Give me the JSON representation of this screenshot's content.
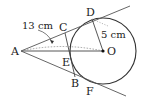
{
  "diagram": {
    "type": "geometry",
    "colors": {
      "stroke": "#333333",
      "dotted": "#888888",
      "background": "#ffffff"
    },
    "points": {
      "A": {
        "label": "A"
      },
      "B": {
        "label": "B"
      },
      "C": {
        "label": "C"
      },
      "D": {
        "label": "D"
      },
      "E": {
        "label": "E"
      },
      "F": {
        "label": "F"
      },
      "O": {
        "label": "O"
      }
    },
    "measurements": {
      "AO": "13 cm",
      "OD": "5 cm"
    }
  }
}
